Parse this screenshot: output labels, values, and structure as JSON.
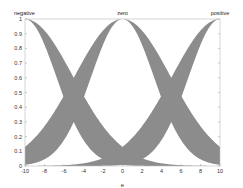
{
  "chart_data": {
    "type": "area",
    "title": "",
    "xlabel": "e",
    "ylabel": "",
    "xlim": [
      -10,
      10
    ],
    "ylim": [
      0,
      1
    ],
    "xticks": [
      -10,
      -8,
      -6,
      -4,
      -2,
      0,
      2,
      4,
      6,
      8,
      10
    ],
    "yticks": [
      0,
      0.1,
      0.2,
      0.3,
      0.4,
      0.5,
      0.6,
      0.7,
      0.8,
      0.9,
      1
    ],
    "ytick_labels": [
      "0",
      "0.1",
      "0.2",
      "0.3",
      "0.4",
      "0.5",
      "0.6",
      "0.7",
      "0.8",
      "0.9",
      "1"
    ],
    "grid": false,
    "legend": "none",
    "fill_color": "#8c8c8c",
    "series": [
      {
        "name": "negative",
        "center": -10,
        "upper_sigma": 4.95,
        "lower_sigma": 3.22
      },
      {
        "name": "zero",
        "center": 0,
        "upper_sigma": 4.95,
        "lower_sigma": 3.22
      },
      {
        "name": "positive",
        "center": 10,
        "upper_sigma": 4.95,
        "lower_sigma": 3.22
      }
    ],
    "annotations": [
      {
        "text": "negative",
        "x": -10,
        "y": 1
      },
      {
        "text": "zero",
        "x": 0,
        "y": 1
      },
      {
        "text": "positive",
        "x": 10,
        "y": 1
      }
    ],
    "key_values": {
      "upper_crossing_at_x_pm5": 0.6,
      "lower_crossing_at_x_pm5": 0.3,
      "upper_value_at_x_pm10_for_zero": 0.13
    }
  },
  "labels": {
    "negative": "negative",
    "zero": "zero",
    "positive": "positive",
    "xlabel": "e"
  }
}
